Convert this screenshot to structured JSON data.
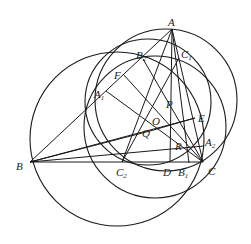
{
  "diagram": {
    "type": "geometry-figure",
    "stroke_color": "#1a1a1a",
    "background": "#ffffff",
    "points": [
      {
        "id": "A",
        "label": "A",
        "sub": ""
      },
      {
        "id": "B",
        "label": "B",
        "sub": ""
      },
      {
        "id": "C",
        "label": "C",
        "sub": ""
      },
      {
        "id": "D",
        "label": "D",
        "sub": ""
      },
      {
        "id": "E",
        "label": "E",
        "sub": ""
      },
      {
        "id": "F",
        "label": "F",
        "sub": ""
      },
      {
        "id": "P",
        "label": "P",
        "sub": ""
      },
      {
        "id": "O",
        "label": "O",
        "sub": ""
      },
      {
        "id": "Q",
        "label": "Q",
        "sub": ""
      },
      {
        "id": "R",
        "label": "R",
        "sub": ""
      },
      {
        "id": "A1",
        "label": "A",
        "sub": "1"
      },
      {
        "id": "A2",
        "label": "A",
        "sub": "2"
      },
      {
        "id": "B1",
        "label": "B",
        "sub": "1"
      },
      {
        "id": "B2",
        "label": "B",
        "sub": "2"
      },
      {
        "id": "C1",
        "label": "C",
        "sub": "1"
      },
      {
        "id": "C2",
        "label": "C",
        "sub": "2"
      }
    ],
    "segments": [
      [
        "A",
        "B"
      ],
      [
        "A",
        "C"
      ],
      [
        "B",
        "C"
      ],
      [
        "A",
        "D"
      ],
      [
        "A",
        "C2"
      ],
      [
        "A",
        "B1"
      ],
      [
        "B",
        "E"
      ],
      [
        "B",
        "Q"
      ],
      [
        "B",
        "A2"
      ],
      [
        "C",
        "F"
      ],
      [
        "C",
        "A1"
      ],
      [
        "C",
        "B2"
      ],
      [
        "C2",
        "C1"
      ],
      [
        "Q",
        "E"
      ]
    ],
    "circles": [
      {
        "name": "circle-left",
        "through": [
          "B",
          "A1",
          "C2",
          "B1"
        ]
      },
      {
        "name": "circle-right",
        "through": [
          "A",
          "C"
        ]
      },
      {
        "name": "circle-mid-1",
        "through": [
          "B2",
          "C1",
          "A2"
        ]
      },
      {
        "name": "circle-mid-2",
        "through": [
          "A1",
          "C2",
          "B1"
        ]
      }
    ]
  }
}
